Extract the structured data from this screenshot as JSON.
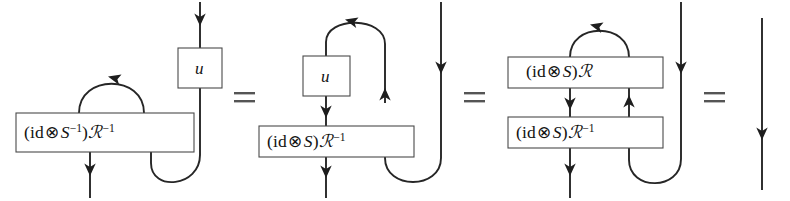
{
  "figure": {
    "kind": "string-diagram-equation",
    "width": 790,
    "height": 201,
    "background_color": "#ffffff",
    "wire_color": "#262626",
    "box_stroke_color": "#4a4a4a",
    "text_color": "#121212"
  },
  "panels": [
    {
      "id": "panel-1",
      "boxes": [
        {
          "id": "p1-u",
          "label": "u",
          "kind": "generator"
        },
        {
          "id": "p1-op",
          "label": "(id ⊗ S⁻¹)ℛ⁻¹",
          "kind": "operator"
        }
      ]
    },
    {
      "id": "panel-2",
      "boxes": [
        {
          "id": "p2-u",
          "label": "u",
          "kind": "generator"
        },
        {
          "id": "p2-op",
          "label": "(id ⊗ S)ℛ⁻¹",
          "kind": "operator"
        }
      ]
    },
    {
      "id": "panel-3",
      "boxes": [
        {
          "id": "p3-op-top",
          "label": "(id ⊗ S)ℛ",
          "kind": "operator"
        },
        {
          "id": "p3-op-bottom",
          "label": "(id ⊗ S)ℛ⁻¹",
          "kind": "operator"
        }
      ]
    },
    {
      "id": "panel-4",
      "boxes": []
    }
  ],
  "equals_signs": [
    {
      "id": "equals-1",
      "label": "=",
      "after_panel": "panel-1"
    },
    {
      "id": "equals-2",
      "label": "=",
      "after_panel": "panel-2"
    },
    {
      "id": "equals-3",
      "label": "=",
      "after_panel": "panel-3"
    }
  ],
  "labels": {
    "p1_u": {
      "text": "u"
    },
    "p1_op": {
      "open_paren": "(",
      "id": "id",
      "otimes": "⊗",
      "antipode": "S",
      "antipode_exp": "−1",
      "close_paren": ")",
      "r_matrix": "ℛ",
      "r_exp": "−1"
    },
    "p2_u": {
      "text": "u"
    },
    "p2_op": {
      "open_paren": "(",
      "id": "id",
      "otimes": "⊗",
      "antipode": "S",
      "close_paren": ")",
      "r_matrix": "ℛ",
      "r_exp": "−1"
    },
    "p3_op_top": {
      "open_paren": "(",
      "id": "id",
      "otimes": "⊗",
      "antipode": "S",
      "close_paren": ")",
      "r_matrix": "ℛ"
    },
    "p3_op_bottom": {
      "open_paren": "(",
      "id": "id",
      "otimes": "⊗",
      "antipode": "S",
      "close_paren": ")",
      "r_matrix": "ℛ",
      "r_exp": "−1"
    },
    "equals": {
      "text": "="
    }
  }
}
